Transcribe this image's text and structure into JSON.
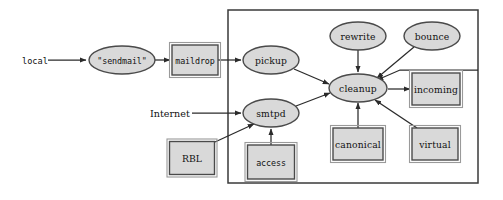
{
  "diagram": {
    "frame": {
      "name": "postfix-boundary",
      "x": 228,
      "y": 10,
      "width": 250,
      "height": 173
    },
    "colors": {
      "node_fill": "#d9d9d9",
      "node_stroke": "#4a4a4a",
      "edge": "#2b2b2b",
      "frame": "#3a3a3a",
      "text": "#111111",
      "background": "#ffffff"
    },
    "io_labels": [
      {
        "id": "local",
        "text": "local",
        "x": 22,
        "y": 61,
        "font": "mono"
      },
      {
        "id": "internet",
        "text": "Internet",
        "x": 150,
        "y": 113,
        "font": "serif"
      }
    ],
    "nodes": [
      {
        "id": "sendmail",
        "label": "\"sendmail\"",
        "shape": "ellipse",
        "cx": 122,
        "cy": 60,
        "rx": 33,
        "ry": 14,
        "font": "mono"
      },
      {
        "id": "maildrop",
        "label": "maildrop",
        "shape": "rect",
        "cx": 195,
        "cy": 60,
        "w": 46,
        "h": 30,
        "font": "mono"
      },
      {
        "id": "pickup",
        "label": "pickup",
        "shape": "ellipse",
        "cx": 271,
        "cy": 60,
        "rx": 28,
        "ry": 14,
        "font": "serif"
      },
      {
        "id": "smtpd",
        "label": "smtpd",
        "shape": "ellipse",
        "cx": 271,
        "cy": 113,
        "rx": 28,
        "ry": 14,
        "font": "serif"
      },
      {
        "id": "rbl",
        "label": "RBL",
        "shape": "rect",
        "cx": 192,
        "cy": 158,
        "w": 45,
        "h": 33,
        "font": "serif"
      },
      {
        "id": "access",
        "label": "access",
        "shape": "rect",
        "cx": 271,
        "cy": 162,
        "w": 47,
        "h": 34,
        "font": "mono"
      },
      {
        "id": "rewrite",
        "label": "rewrite",
        "shape": "ellipse",
        "cx": 358,
        "cy": 36,
        "rx": 28,
        "ry": 14,
        "font": "serif"
      },
      {
        "id": "bounce",
        "label": "bounce",
        "shape": "ellipse",
        "cx": 432,
        "cy": 36,
        "rx": 28,
        "ry": 14,
        "font": "serif"
      },
      {
        "id": "cleanup",
        "label": "cleanup",
        "shape": "ellipse",
        "cx": 358,
        "cy": 88,
        "rx": 29,
        "ry": 14,
        "font": "serif"
      },
      {
        "id": "incoming",
        "label": "incoming",
        "shape": "rect",
        "cx": 436,
        "cy": 89,
        "w": 48,
        "h": 32,
        "font": "serif"
      },
      {
        "id": "canonical",
        "label": "canonical",
        "shape": "rect",
        "cx": 358,
        "cy": 144,
        "w": 50,
        "h": 32,
        "font": "serif"
      },
      {
        "id": "virtual",
        "label": "virtual",
        "shape": "rect",
        "cx": 435,
        "cy": 144,
        "w": 46,
        "h": 32,
        "font": "serif"
      }
    ],
    "edges": [
      {
        "id": "local-to-sendmail",
        "from": "local",
        "to": "sendmail",
        "d": "M 48 60 L 86 60",
        "arrow": true
      },
      {
        "id": "sendmail-to-maildrop",
        "from": "sendmail",
        "to": "maildrop",
        "d": "M 155 60 L 170 60",
        "arrow": true
      },
      {
        "id": "maildrop-to-pickup",
        "from": "maildrop",
        "to": "pickup",
        "d": "M 218 60 L 241 60",
        "arrow": true
      },
      {
        "id": "internet-to-smtpd",
        "from": "internet",
        "to": "smtpd",
        "d": "M 192 113 L 241 113",
        "arrow": true
      },
      {
        "id": "rbl-to-smtpd",
        "from": "rbl",
        "to": "smtpd",
        "d": "M 215 142 L 254 124",
        "arrow": true
      },
      {
        "id": "access-to-smtpd",
        "from": "access",
        "to": "smtpd",
        "d": "M 271 145 L 271 129",
        "arrow": true
      },
      {
        "id": "pickup-to-cleanup",
        "from": "pickup",
        "to": "cleanup",
        "d": "M 294 69 L 329 84",
        "arrow": true
      },
      {
        "id": "smtpd-to-cleanup",
        "from": "smtpd",
        "to": "cleanup",
        "d": "M 296 106 L 330 93",
        "arrow": true
      },
      {
        "id": "rewrite-to-cleanup",
        "from": "rewrite",
        "to": "cleanup",
        "d": "M 358 50 L 358 72",
        "arrow": true
      },
      {
        "id": "bounce-to-cleanup",
        "from": "bounce",
        "to": "cleanup",
        "d": "M 414 47 L 377 78",
        "arrow": true
      },
      {
        "id": "canonical-to-cleanup",
        "from": "canonical",
        "to": "cleanup",
        "d": "M 358 128 L 358 103",
        "arrow": true
      },
      {
        "id": "virtual-to-cleanup",
        "from": "virtual",
        "to": "cleanup",
        "d": "M 417 128 L 375 100",
        "arrow": true
      },
      {
        "id": "cleanup-to-incoming",
        "from": "cleanup",
        "to": "incoming",
        "d": "M 388 89 L 410 89",
        "arrow": true
      },
      {
        "id": "incoming-feedback",
        "from": "incoming",
        "to": "bounce",
        "d": "M 478 70 L 400 70 L 377 80",
        "arrow": true
      }
    ]
  }
}
